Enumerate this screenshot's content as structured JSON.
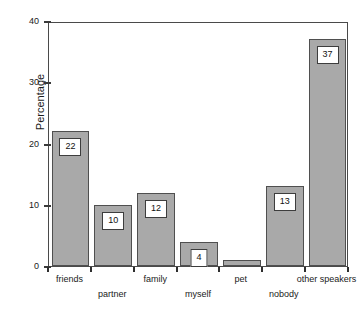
{
  "chart_data": {
    "type": "bar",
    "title": "",
    "subtitle": "",
    "xlabel": "",
    "ylabel": "Percentage",
    "categories": [
      "friends",
      "partner",
      "family",
      "myself",
      "pet",
      "nobody",
      "other speakers"
    ],
    "values": [
      22,
      10,
      12,
      4,
      1,
      13,
      37
    ],
    "data_labels": [
      "22",
      "10",
      "12",
      "4",
      "",
      "13",
      "37"
    ],
    "ylim": [
      0,
      40
    ],
    "yticks": [
      0,
      10,
      20,
      30,
      40
    ],
    "ytick_labels": [
      "0",
      "10",
      "20",
      "30",
      "40"
    ],
    "grid": false,
    "legend": null,
    "legend_position": "none",
    "bar_color": "#a9a9a9",
    "bar_edge_color": "#4f4f4f",
    "axis_color": "#4a4a4a",
    "background": "#ffffff",
    "label_rows": [
      0,
      1,
      0,
      1,
      0,
      1,
      0
    ]
  }
}
